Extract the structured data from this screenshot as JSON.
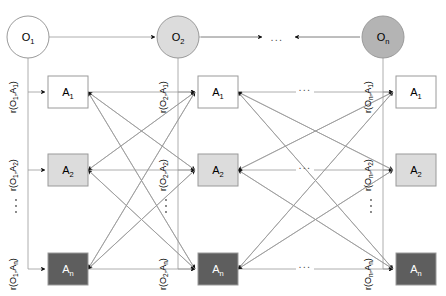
{
  "diagram": {
    "colors": {
      "edge": "#9a9a9a",
      "arrow": "#111111",
      "node_border": "#9a9a9a",
      "circle_1_fill": "#ffffff",
      "circle_2_fill": "#dcdcdc",
      "circle_n_fill": "#b4b4b4",
      "box_1_fill": "#ffffff",
      "box_2_fill": "#dcdcdc",
      "box_n_fill": "#5e5e5e",
      "text_dark": "#000000",
      "text_light": "#ffffff"
    },
    "objects": [
      {
        "id": "O1",
        "base": "O",
        "sub": "1",
        "cx": 28,
        "cy": 37,
        "r": 21,
        "fill_key": "circle_1_fill",
        "text_light": false
      },
      {
        "id": "O2",
        "base": "O",
        "sub": "2",
        "cx": 178,
        "cy": 37,
        "r": 21,
        "fill_key": "circle_2_fill",
        "text_light": false
      },
      {
        "id": "On",
        "base": "O",
        "sub": "n",
        "cx": 383,
        "cy": 37,
        "r": 21,
        "fill_key": "circle_n_fill",
        "text_light": false
      }
    ],
    "attribute_columns": [
      {
        "object": "O1",
        "boxes": [
          {
            "id": "A1",
            "base": "A",
            "sub": "1",
            "x": 48,
            "y": 76,
            "w": 40,
            "h": 32,
            "fill_key": "box_1_fill",
            "text_light": false
          },
          {
            "id": "A2",
            "base": "A",
            "sub": "2",
            "x": 48,
            "y": 154,
            "w": 40,
            "h": 32,
            "fill_key": "box_2_fill",
            "text_light": false
          },
          {
            "id": "An",
            "base": "A",
            "sub": "n",
            "x": 48,
            "y": 253,
            "w": 40,
            "h": 32,
            "fill_key": "box_n_fill",
            "text_light": true
          }
        ]
      },
      {
        "object": "O2",
        "boxes": [
          {
            "id": "A1",
            "base": "A",
            "sub": "1",
            "x": 198,
            "y": 76,
            "w": 40,
            "h": 32,
            "fill_key": "box_1_fill",
            "text_light": false
          },
          {
            "id": "A2",
            "base": "A",
            "sub": "2",
            "x": 198,
            "y": 154,
            "w": 40,
            "h": 32,
            "fill_key": "box_2_fill",
            "text_light": false
          },
          {
            "id": "An",
            "base": "A",
            "sub": "n",
            "x": 198,
            "y": 253,
            "w": 40,
            "h": 32,
            "fill_key": "box_n_fill",
            "text_light": true
          }
        ]
      },
      {
        "object": "On",
        "boxes": [
          {
            "id": "A1",
            "base": "A",
            "sub": "1",
            "x": 396,
            "y": 76,
            "w": 40,
            "h": 32,
            "fill_key": "box_1_fill",
            "text_light": false
          },
          {
            "id": "A2",
            "base": "A",
            "sub": "2",
            "x": 396,
            "y": 154,
            "w": 40,
            "h": 32,
            "fill_key": "box_2_fill",
            "text_light": false
          },
          {
            "id": "An",
            "base": "A",
            "sub": "n",
            "x": 396,
            "y": 253,
            "w": 40,
            "h": 32,
            "fill_key": "box_n_fill",
            "text_light": true
          }
        ]
      }
    ],
    "relation_labels": [
      {
        "id": "r-O1-A1",
        "prefix": "r(O",
        "sub1": "1",
        "mid": ",A",
        "sub2": "1",
        "suffix": ")",
        "x": 16,
        "y": 97
      },
      {
        "id": "r-O1-A2",
        "prefix": "r(O",
        "sub1": "1",
        "mid": ",A",
        "sub2": "2",
        "suffix": ")",
        "x": 16,
        "y": 175
      },
      {
        "id": "r-O1-An",
        "prefix": "r(O",
        "sub1": "1",
        "mid": ",A",
        "sub2": "n",
        "suffix": ")",
        "x": 16,
        "y": 274
      },
      {
        "id": "r-O2-A1",
        "prefix": "r(O",
        "sub1": "2",
        "mid": ",A",
        "sub2": "1",
        "suffix": ")",
        "x": 166,
        "y": 97
      },
      {
        "id": "r-O2-A2",
        "prefix": "r(O",
        "sub1": "2",
        "mid": ",A",
        "sub2": "2",
        "suffix": ")",
        "x": 166,
        "y": 175
      },
      {
        "id": "r-O2-An",
        "prefix": "r(O",
        "sub1": "2",
        "mid": ",A",
        "sub2": "n",
        "suffix": ")",
        "x": 166,
        "y": 274
      },
      {
        "id": "r-On-A1",
        "prefix": "r(O",
        "sub1": "n",
        "mid": ",A",
        "sub2": "1",
        "suffix": ")",
        "x": 371,
        "y": 97
      },
      {
        "id": "r-On-A2",
        "prefix": "r(O",
        "sub1": "n",
        "mid": ",A",
        "sub2": "2",
        "suffix": ")",
        "x": 371,
        "y": 175
      },
      {
        "id": "r-On-An",
        "prefix": "r(O",
        "sub1": "n",
        "mid": ",A",
        "sub2": "n",
        "suffix": ")",
        "x": 371,
        "y": 274
      }
    ],
    "ellipses_horizontal": [
      {
        "id": "dots-objects-row",
        "text": "...",
        "x": 277,
        "y": 41
      },
      {
        "id": "dots-a1-row",
        "text": "...",
        "x": 305,
        "y": 91
      },
      {
        "id": "dots-a2-row",
        "text": "...",
        "x": 305,
        "y": 169
      },
      {
        "id": "dots-an-row",
        "text": "...",
        "x": 305,
        "y": 268
      }
    ],
    "ellipses_vertical": [
      {
        "id": "dots-col1",
        "x": 16,
        "y1": 200,
        "y2": 206,
        "y3": 212
      },
      {
        "id": "dots-col2",
        "x": 166,
        "y1": 200,
        "y2": 206,
        "y3": 212
      },
      {
        "id": "dots-col3",
        "x": 371,
        "y1": 200,
        "y2": 206,
        "y3": 212
      }
    ]
  }
}
